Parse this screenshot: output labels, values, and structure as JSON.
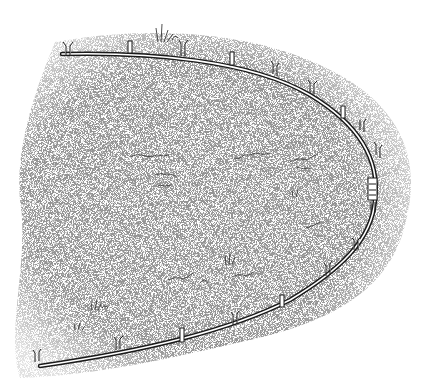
{
  "illustration": {
    "subject": "pen-and-ink drawing of a curved hose laid in a U shape on stippled ground, staked down with small pegs",
    "colors": {
      "background": "#ffffff",
      "ink": "#1a1a1a",
      "stipple": "#555555"
    },
    "hose": {
      "path": "M62,54 C150,52 250,60 310,95 C360,125 380,160 375,200 C372,240 340,270 290,300 C230,330 150,350 40,365",
      "stakes": [
        [
          68,
          48
        ],
        [
          130,
          44
        ],
        [
          183,
          48
        ],
        [
          232,
          56
        ],
        [
          275,
          68
        ],
        [
          313,
          88
        ],
        [
          343,
          118
        ],
        [
          362,
          145
        ],
        [
          375,
          178
        ],
        [
          372,
          210
        ],
        [
          355,
          245
        ],
        [
          320,
          268
        ],
        [
          282,
          297
        ],
        [
          235,
          320
        ],
        [
          180,
          332
        ],
        [
          118,
          340
        ],
        [
          38,
          353
        ]
      ]
    },
    "grass_tufts": [
      [
        160,
        28
      ],
      [
        225,
        262
      ],
      [
        95,
        305
      ],
      [
        80,
        325
      ],
      [
        295,
        193
      ]
    ],
    "rocks": [
      [
        140,
        155
      ],
      [
        165,
        180
      ],
      [
        245,
        158
      ],
      [
        300,
        160
      ],
      [
        320,
        148
      ],
      [
        210,
        272
      ],
      [
        245,
        280
      ],
      [
        170,
        272
      ]
    ]
  }
}
